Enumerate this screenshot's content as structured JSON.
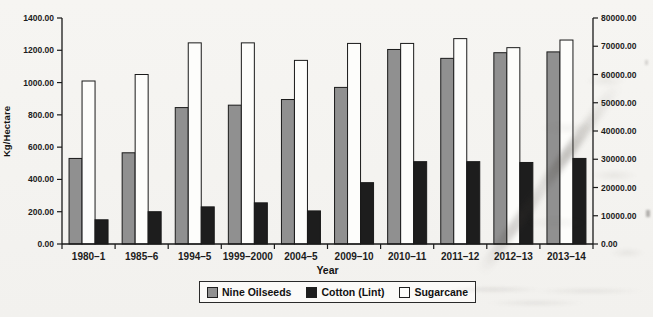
{
  "figure": {
    "background_color": "#f4f3f0",
    "outline_color": "#1a1a1a",
    "axis_color": "#1a1a1a",
    "tick_label_color": "#1c1c1c"
  },
  "chart_data": {
    "type": "bar",
    "title": "",
    "xlabel": "Year",
    "ylabel_left": "Kg/Hectare",
    "ylabel_right": "Sugarcane (kg/Hectare)",
    "categories": [
      "1980–1",
      "1985–6",
      "1994–5",
      "1999–2000",
      "2004–5",
      "2009–10",
      "2010–11",
      "2011–12",
      "2012–13",
      "2013–14"
    ],
    "series": [
      {
        "name": "Nine Oilseeds",
        "axis": "left",
        "color": "#909090",
        "values": [
          530,
          565,
          845,
          860,
          895,
          970,
          1205,
          1150,
          1185,
          1190
        ]
      },
      {
        "name": "Cotton (Lint)",
        "axis": "left",
        "color": "#1d1d1d",
        "values": [
          150,
          200,
          230,
          255,
          205,
          380,
          510,
          510,
          505,
          530
        ]
      },
      {
        "name": "Sugarcane",
        "axis": "right",
        "color": "#fdfdfb",
        "values": [
          57700,
          60000,
          71200,
          71200,
          65000,
          71000,
          71000,
          72700,
          69500,
          72200
        ]
      }
    ],
    "bar_draw_order": [
      "Nine Oilseeds",
      "Sugarcane",
      "Cotton (Lint)"
    ],
    "left_axis": {
      "min": 0,
      "max": 1400,
      "step": 200,
      "tick_labels": [
        "0.00",
        "200.00",
        "400.00",
        "600.00",
        "800.00",
        "1000.00",
        "1200.00",
        "1400.00"
      ]
    },
    "right_axis": {
      "min": 0,
      "max": 80000,
      "step": 10000,
      "tick_labels": [
        "0.00",
        "10000.00",
        "20000.00",
        "30000.00",
        "40000.00",
        "50000.00",
        "60000.00",
        "70000.00",
        "80000.00"
      ]
    },
    "legend": [
      "Nine Oilseeds",
      "Cotton (Lint)",
      "Sugarcane"
    ],
    "legend_position": "bottom",
    "grid": false
  }
}
